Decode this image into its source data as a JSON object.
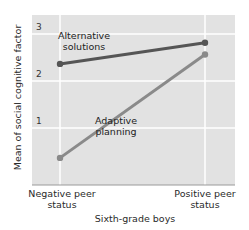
{
  "chart_data": {
    "type": "line",
    "title": "",
    "xlabel": "Sixth-grade boys",
    "ylabel": "Mean of social cognitive factor",
    "categories": [
      "Negative peer status",
      "Positive peer status"
    ],
    "category_lines": [
      [
        "Negative peer",
        "status"
      ],
      [
        "Positive peer",
        "status"
      ]
    ],
    "yticks": [
      1,
      2,
      3
    ],
    "ylim": [
      0,
      3.3
    ],
    "grid": true,
    "series": [
      {
        "name": "Alternative solutions",
        "label_lines": [
          "Alternative",
          "solutions"
        ],
        "values": [
          2.3,
          2.75
        ],
        "color": "#555555"
      },
      {
        "name": "Adaptive planning",
        "label_lines": [
          "Adaptive",
          "planning"
        ],
        "values": [
          0.3,
          2.5
        ],
        "color": "#8a8a8a"
      }
    ],
    "colors": {
      "plot_bg": "#e2e2e2",
      "grid": "#ffffff"
    }
  }
}
